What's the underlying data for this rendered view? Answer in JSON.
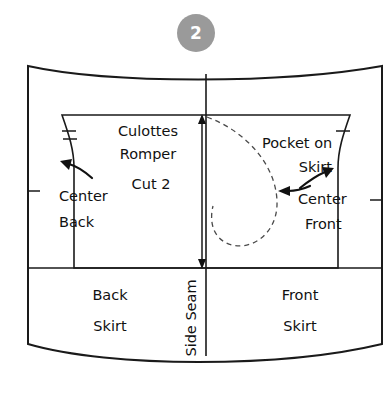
{
  "step": {
    "number": "2",
    "badge_color": "#9a9a9a",
    "badge_text_color": "#ffffff"
  },
  "pattern": {
    "title_line1": "Culottes",
    "title_line2": "Romper",
    "cut_instruction": "Cut 2",
    "labels": {
      "center_back_line1": "Center",
      "center_back_line2": "Back",
      "center_front_line1": "Center",
      "center_front_line2": "Front",
      "pocket_line1": "Pocket on",
      "pocket_line2": "Skirt",
      "back_skirt_line1": "Back",
      "back_skirt_line2": "Skirt",
      "front_skirt_line1": "Front",
      "front_skirt_line2": "Skirt",
      "side_seam": "Side Seam"
    },
    "colors": {
      "outline": "#1a1a1a",
      "fill": "#ffffff",
      "dashed_pocket": "#4a4a4a",
      "text": "#111111"
    },
    "icons": {
      "grainline": "double-headed-arrow",
      "pointer_center_back": "arrow-up-left",
      "pointer_center_front": "arrow-up-right",
      "pointer_pocket": "arrow-left"
    }
  }
}
